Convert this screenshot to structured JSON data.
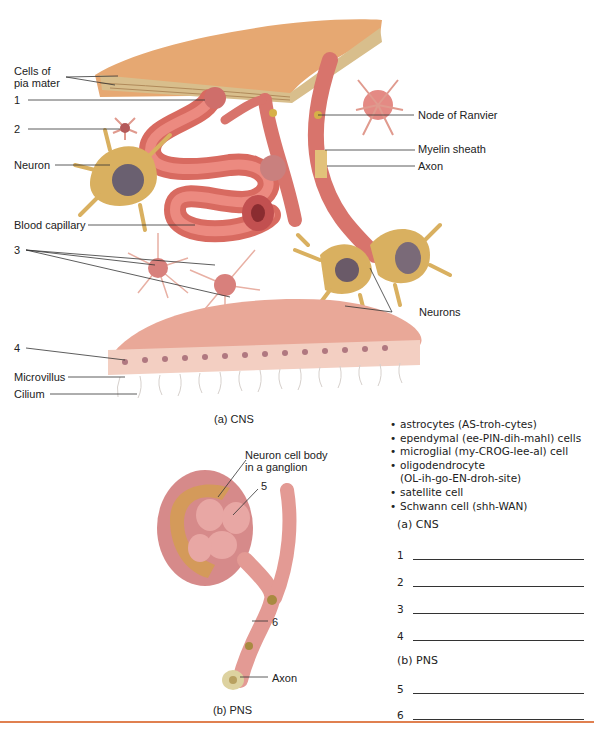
{
  "cns_figure": {
    "caption": "(a) CNS",
    "labels": {
      "cells_of_pia_mater": [
        "Cells of",
        "pia mater"
      ],
      "label_1": "1",
      "label_2": "2",
      "neuron": "Neuron",
      "blood_capillary": "Blood capillary",
      "label_3": "3",
      "label_4": "4",
      "microvillus": "Microvillus",
      "cilium": "Cilium",
      "node_of_ranvier": "Node of Ranvier",
      "myelin_sheath": "Myelin sheath",
      "axon": "Axon",
      "neurons": "Neurons"
    }
  },
  "pns_figure": {
    "caption": "(b) PNS",
    "labels": {
      "neuron_cell_body": [
        "Neuron cell body",
        "in a ganglion"
      ],
      "label_5": "5",
      "label_6": "6",
      "axon": "Axon"
    }
  },
  "term_list": [
    "astrocytes (AS-troh-cytes)",
    "ependymal (ee-PIN-dih-mahl) cells",
    "microglial (my-CROG-lee-al) cell",
    "oligodendrocyte",
    "(OL-ih-go-EN-droh-site)",
    "satellite cell",
    "Schwann cell (shh-WAN)"
  ],
  "answer_sections": [
    {
      "heading": "(a)  CNS",
      "blanks": [
        "1",
        "2",
        "3",
        "4"
      ]
    },
    {
      "heading": "(b)  PNS",
      "blanks": [
        "5",
        "6"
      ]
    }
  ],
  "colors": {
    "footer_rule": "#e08050",
    "pia_mater": "#e0a66a",
    "capillary": "#d8615a",
    "glia": "#e9b4a8",
    "neuron": "#d9b060",
    "ependymal": "#f0c0b0"
  }
}
